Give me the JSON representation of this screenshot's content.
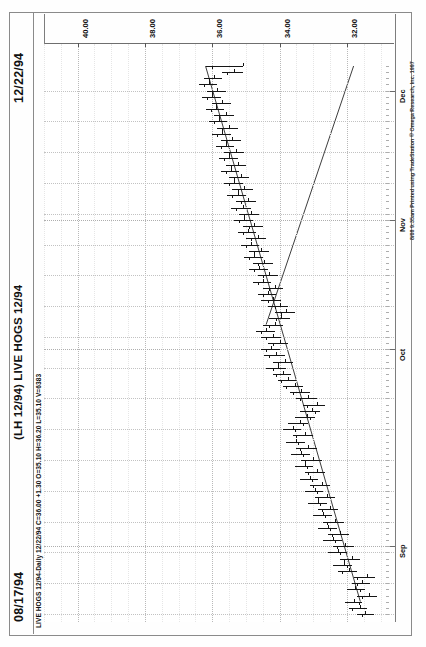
{
  "window": {
    "app": "TradeStation",
    "date_left": "08/17/94",
    "date_right": "12/22/94",
    "chart_title": "(LH 12/94) LIVE HOGS 12/94",
    "quote_line": "LIVE HOGS 12/94-Daily  12/22/94  C=36.00  +1.30  O=35.10  H=36.20  L=35.10  V=6383",
    "copyright": "8/08  9:35am  Printed using TradeStation © Omega Research, Inc. 1997"
  },
  "quote": {
    "symbol": "LIVE HOGS 12/94-Daily",
    "date": "12/22/94",
    "close_label": "C=36.00",
    "change_label": "+1.30",
    "open_label": "O=35.10",
    "high_label": "H=36.20",
    "low_label": "L=35.10",
    "volume_label": "V=6383"
  },
  "chart_data": {
    "type": "bar",
    "subtype": "ohlc-bar-chart",
    "title": "(LH 12/94) LIVE HOGS 12/94",
    "xlabel": "",
    "ylabel": "",
    "orientation": "rotated-90-counterclockwise",
    "grid": true,
    "legend_position": "none",
    "price_axis": {
      "tick_labels": [
        "40.00",
        "38.00",
        "36.00",
        "34.00",
        "32.00"
      ],
      "tick_values": [
        40.0,
        38.0,
        36.0,
        34.0,
        32.0
      ],
      "range": [
        30.6,
        41.0
      ],
      "minor_interval": 0.5
    },
    "time_axis": {
      "tick_labels": [
        "Sep",
        "Oct",
        "Nov",
        "Dec"
      ],
      "start": "08/17/94",
      "end": "12/22/94",
      "bar_count": 90
    },
    "annotations": [
      {
        "type": "trendline",
        "name": "rising-support-trendline",
        "from": {
          "date_index": 2,
          "price": 31.6
        },
        "to": {
          "date_index": 89,
          "price": 36.2
        }
      },
      {
        "type": "trendline",
        "name": "falling-resistance-trendline",
        "from": {
          "date_index": 47,
          "price": 34.4
        },
        "to": {
          "date_index": 89,
          "price": 31.8
        }
      }
    ],
    "series": [
      {
        "name": "Open",
        "values": [
          31.45,
          31.6,
          31.8,
          31.35,
          31.75,
          31.55,
          31.4,
          31.95,
          32.1,
          31.85,
          32.25,
          32.05,
          32.4,
          32.2,
          32.55,
          32.35,
          32.7,
          32.5,
          32.85,
          32.6,
          32.95,
          32.75,
          33.1,
          32.9,
          33.25,
          33.0,
          33.35,
          33.15,
          33.5,
          33.25,
          33.6,
          33.4,
          33.2,
          33.05,
          32.9,
          33.15,
          33.35,
          33.55,
          33.75,
          33.9,
          34.05,
          33.85,
          34.1,
          34.25,
          34.0,
          34.2,
          34.4,
          34.15,
          33.95,
          33.8,
          34.0,
          34.2,
          34.35,
          34.15,
          34.5,
          34.3,
          34.6,
          34.45,
          34.75,
          34.55,
          34.85,
          34.65,
          34.95,
          34.75,
          35.05,
          34.85,
          35.1,
          34.95,
          35.25,
          35.05,
          35.35,
          35.15,
          35.45,
          35.25,
          35.5,
          35.3,
          35.6,
          35.4,
          35.7,
          35.5,
          35.8,
          35.6,
          35.9,
          35.7,
          36.0,
          35.85,
          36.1,
          35.95,
          35.35,
          35.1
        ]
      },
      {
        "name": "High",
        "values": [
          31.7,
          31.95,
          32.05,
          31.7,
          32.0,
          31.85,
          31.8,
          32.25,
          32.4,
          32.2,
          32.55,
          32.4,
          32.7,
          32.55,
          32.85,
          32.7,
          33.0,
          32.85,
          33.15,
          32.95,
          33.25,
          33.1,
          33.4,
          33.25,
          33.55,
          33.35,
          33.65,
          33.5,
          33.8,
          33.6,
          33.9,
          33.75,
          33.55,
          33.4,
          33.3,
          33.5,
          33.7,
          33.9,
          34.05,
          34.2,
          34.4,
          34.2,
          34.45,
          34.55,
          34.35,
          34.55,
          34.7,
          34.5,
          34.3,
          34.15,
          34.35,
          34.55,
          34.65,
          34.5,
          34.8,
          34.65,
          34.9,
          34.8,
          35.05,
          34.9,
          35.15,
          35.0,
          35.25,
          35.1,
          35.35,
          35.2,
          35.45,
          35.3,
          35.55,
          35.4,
          35.65,
          35.5,
          35.75,
          35.6,
          35.8,
          35.65,
          35.9,
          35.75,
          36.0,
          35.85,
          36.1,
          35.95,
          36.2,
          36.0,
          36.3,
          36.15,
          36.4,
          36.25,
          35.7,
          36.2
        ]
      },
      {
        "name": "Low",
        "values": [
          31.2,
          31.4,
          31.55,
          31.1,
          31.45,
          31.3,
          31.15,
          31.7,
          31.85,
          31.6,
          32.0,
          31.8,
          32.15,
          31.95,
          32.3,
          32.1,
          32.45,
          32.25,
          32.6,
          32.35,
          32.7,
          32.5,
          32.85,
          32.65,
          33.0,
          32.75,
          33.1,
          32.9,
          33.25,
          33.0,
          33.35,
          33.15,
          32.95,
          32.8,
          32.65,
          32.9,
          33.1,
          33.3,
          33.5,
          33.65,
          33.8,
          33.6,
          33.85,
          34.0,
          33.75,
          33.95,
          34.15,
          33.9,
          33.7,
          33.55,
          33.75,
          33.95,
          34.1,
          33.9,
          34.25,
          34.05,
          34.35,
          34.2,
          34.5,
          34.3,
          34.6,
          34.4,
          34.7,
          34.5,
          34.8,
          34.6,
          34.85,
          34.7,
          35.0,
          34.8,
          35.1,
          34.9,
          35.2,
          35.0,
          35.25,
          35.05,
          35.35,
          35.15,
          35.45,
          35.25,
          35.55,
          35.35,
          35.65,
          35.45,
          35.75,
          35.6,
          35.85,
          35.7,
          35.1,
          35.1
        ]
      },
      {
        "name": "Close",
        "values": [
          31.55,
          31.85,
          31.65,
          31.55,
          31.6,
          31.7,
          31.7,
          32.15,
          32.0,
          32.1,
          32.2,
          32.3,
          32.35,
          32.45,
          32.5,
          32.6,
          32.65,
          32.75,
          32.8,
          32.85,
          32.9,
          33.0,
          33.05,
          33.15,
          33.2,
          33.25,
          33.3,
          33.4,
          33.45,
          33.5,
          33.55,
          33.3,
          33.1,
          32.95,
          33.2,
          33.4,
          33.6,
          33.8,
          33.95,
          34.1,
          34.2,
          34.05,
          34.3,
          34.4,
          34.2,
          34.4,
          34.55,
          34.3,
          34.1,
          33.95,
          34.15,
          34.35,
          34.5,
          34.3,
          34.65,
          34.5,
          34.75,
          34.65,
          34.9,
          34.75,
          35.0,
          34.85,
          35.1,
          34.9,
          35.2,
          35.05,
          35.3,
          35.15,
          35.4,
          35.25,
          35.5,
          35.35,
          35.6,
          35.45,
          35.65,
          35.5,
          35.75,
          35.6,
          35.85,
          35.7,
          35.95,
          35.8,
          36.05,
          35.9,
          36.15,
          36.0,
          36.25,
          36.1,
          35.55,
          36.0
        ]
      }
    ]
  },
  "ui": {
    "icon_names": [
      "chart-bars-icon",
      "trendline-icon"
    ],
    "accent_color": "#151515",
    "grid_color": "#c2c2c2",
    "axis_color": "#6e6e6e"
  }
}
